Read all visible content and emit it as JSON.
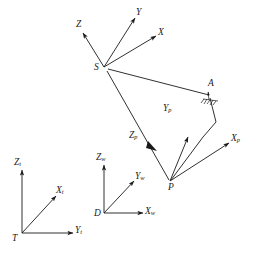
{
  "figure": {
    "type": "vector-coordinate-frame-diagram",
    "background_color": "#ffffff",
    "stroke_color": "#1a1a1a",
    "width": 253,
    "height": 258
  },
  "frames": {
    "sensor": {
      "origin_label": "S",
      "axes": [
        {
          "name": "Z",
          "label": "Z",
          "subscript": ""
        },
        {
          "name": "Y",
          "label": "Y",
          "subscript": ""
        },
        {
          "name": "X",
          "label": "X",
          "subscript": ""
        }
      ]
    },
    "platform": {
      "origin_label": "P",
      "axes": [
        {
          "name": "Zp",
          "label": "Z",
          "subscript": "p"
        },
        {
          "name": "Yp",
          "label": "Y",
          "subscript": "p"
        },
        {
          "name": "Xp",
          "label": "X",
          "subscript": "p"
        }
      ]
    },
    "target": {
      "origin_label": "T",
      "axes": [
        {
          "name": "Zt",
          "label": "Z",
          "subscript": "t"
        },
        {
          "name": "Xt",
          "label": "X",
          "subscript": "t"
        },
        {
          "name": "Yt",
          "label": "Y",
          "subscript": "t"
        }
      ]
    },
    "world": {
      "origin_label": "D",
      "axes": [
        {
          "name": "Zw",
          "label": "Z",
          "subscript": "w"
        },
        {
          "name": "Yw",
          "label": "Y",
          "subscript": "w"
        },
        {
          "name": "Xw",
          "label": "X",
          "subscript": "w"
        }
      ]
    }
  },
  "points": [
    {
      "name": "S",
      "label": "S"
    },
    {
      "name": "A",
      "label": "A"
    },
    {
      "name": "P",
      "label": "P"
    }
  ],
  "labels": {
    "S": "S",
    "A": "A",
    "P": "P",
    "T": "T",
    "D": "D",
    "Z": "Z",
    "Y": "Y",
    "X": "X",
    "Zp_base": "Z",
    "Zp_sub": "p",
    "Yp_base": "Y",
    "Yp_sub": "p",
    "Xp_base": "X",
    "Xp_sub": "p",
    "Zt_base": "Z",
    "Zt_sub": "t",
    "Xt_base": "X",
    "Xt_sub": "t",
    "Yt_base": "Y",
    "Yt_sub": "t",
    "Zw_base": "Z",
    "Zw_sub": "w",
    "Yw_base": "Y",
    "Yw_sub": "w",
    "Xw_base": "X",
    "Xw_sub": "w"
  }
}
